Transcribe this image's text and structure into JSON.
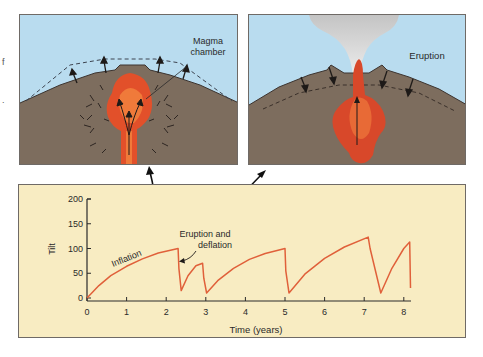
{
  "figure": {
    "left_panel": {
      "label": "Magma chamber",
      "label_lines": [
        "Magma",
        "chamber"
      ],
      "state": "inflation",
      "colors": {
        "sky": "#b9dcef",
        "ground": "#7d6d5e",
        "magma": "#e2502a",
        "magma_core": "#f07a3a"
      }
    },
    "right_panel": {
      "label": "Eruption",
      "state": "deflation",
      "colors": {
        "sky": "#b9dcef",
        "ground": "#7d6d5e",
        "magma": "#d8482a",
        "plume": "#cfcfcf"
      }
    },
    "edge_fragments": [
      "f",
      "."
    ]
  },
  "chart_data": {
    "type": "line",
    "title": "",
    "xlabel": "Time (years)",
    "ylabel": "Tilt",
    "xlim": [
      0,
      8.2
    ],
    "ylim": [
      0,
      200
    ],
    "x_ticks": [
      0,
      1,
      2,
      3,
      4,
      5,
      6,
      7,
      8
    ],
    "y_ticks": [
      0,
      50,
      100,
      150,
      200
    ],
    "grid": false,
    "background": "#f8ecc2",
    "line_color": "#e0603a",
    "annotations": [
      {
        "text": "Inflation",
        "x": 1.1,
        "y": 70
      },
      {
        "text": "Eruption and deflation",
        "x": 2.4,
        "y": 115
      }
    ],
    "series": [
      {
        "name": "Tilt",
        "x": [
          0,
          0.3,
          0.6,
          1.0,
          1.4,
          1.8,
          2.3,
          2.32,
          2.38,
          2.55,
          2.75,
          2.92,
          2.95,
          3.02,
          3.3,
          3.7,
          4.1,
          4.5,
          5.0,
          5.02,
          5.1,
          5.5,
          6.0,
          6.5,
          7.1,
          7.15,
          7.42,
          7.7,
          8.0,
          8.15,
          8.17
        ],
        "values": [
          0,
          25,
          45,
          64,
          79,
          91,
          100,
          60,
          15,
          45,
          65,
          70,
          40,
          10,
          35,
          60,
          78,
          90,
          100,
          55,
          10,
          48,
          80,
          103,
          123,
          100,
          10,
          60,
          100,
          113,
          20
        ]
      }
    ]
  },
  "chart_labels": {
    "ylabel": "Tilt",
    "xlabel": "Time (years)",
    "inflation": "Inflation",
    "eruption_line1": "Eruption and",
    "eruption_line2": "deflation",
    "y_ticks": [
      "200",
      "150",
      "100",
      "50",
      "0"
    ],
    "x_ticks": [
      "0",
      "1",
      "2",
      "3",
      "4",
      "5",
      "6",
      "7",
      "8"
    ]
  }
}
